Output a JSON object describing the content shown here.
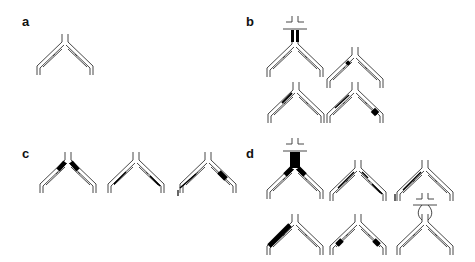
{
  "figure": {
    "panels": [
      {
        "id": "a",
        "label": "a",
        "glyphs": [
          {
            "name": "antibody",
            "apex": [
              65,
              42
            ],
            "highlight": "none"
          }
        ]
      },
      {
        "id": "b",
        "label": "b",
        "glyphs": [
          {
            "name": "antibody-with-receptor",
            "apex": [
              295,
              44
            ],
            "highlight": "hinge-heavy"
          },
          {
            "name": "antibody",
            "apex": [
              355,
              55
            ],
            "highlight": "left-arm-small-dot"
          },
          {
            "name": "antibody",
            "apex": [
              296,
              90
            ],
            "highlight": "left-arm-thin"
          },
          {
            "name": "antibody",
            "apex": [
              355,
              90
            ],
            "highlight": "right-arm-tip-block"
          }
        ]
      },
      {
        "id": "c",
        "label": "c",
        "glyphs": [
          {
            "name": "antibody",
            "apex": [
              68,
              160
            ],
            "highlight": "both-upper-arms"
          },
          {
            "name": "antibody",
            "apex": [
              136,
              160
            ],
            "highlight": "thin-lines"
          },
          {
            "name": "antibody",
            "apex": [
              208,
              160
            ],
            "highlight": "right-arm-mid-block"
          }
        ]
      },
      {
        "id": "d",
        "label": "d",
        "glyphs": [
          {
            "name": "antibody-with-receptor",
            "apex": [
              295,
              166
            ],
            "highlight": "stem-and-arms"
          },
          {
            "name": "antibody",
            "apex": [
              358,
              168
            ],
            "highlight": "thin-lines"
          },
          {
            "name": "antibody",
            "apex": [
              425,
              168
            ],
            "highlight": "left-arm-thin"
          },
          {
            "name": "antibody",
            "apex": [
              295,
              222
            ],
            "highlight": "left-arm-full"
          },
          {
            "name": "antibody",
            "apex": [
              358,
              222
            ],
            "highlight": "both-arm-blocks"
          },
          {
            "name": "antibody-with-receptor-loop",
            "apex": [
              425,
              222
            ],
            "highlight": "hinge-loop"
          }
        ]
      }
    ],
    "colors": {
      "stroke": "#333333",
      "fill": "#000000",
      "background": "#ffffff"
    }
  }
}
